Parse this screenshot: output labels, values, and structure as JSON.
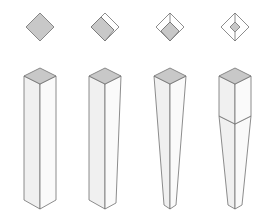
{
  "diagram": {
    "title": "",
    "colors": {
      "background": "#ffffff",
      "top_face": "#c8c8c8",
      "side_face_left": "#f2f2f2",
      "side_face_right": "#fafafa",
      "stroke": "#707070"
    },
    "columns": [
      {
        "id": "straight",
        "plan_view": {
          "type": "full-diamond"
        },
        "leg": {
          "type": "straight",
          "taper": "none"
        }
      },
      {
        "id": "one-side-taper",
        "plan_view": {
          "type": "offset-diamond"
        },
        "leg": {
          "type": "tapered",
          "taper": "one-side"
        }
      },
      {
        "id": "two-side-taper",
        "plan_view": {
          "type": "corner-diamond"
        },
        "leg": {
          "type": "tapered",
          "taper": "two-sides"
        }
      },
      {
        "id": "four-side-taper",
        "plan_view": {
          "type": "centered-diamond"
        },
        "leg": {
          "type": "tapered",
          "taper": "four-sides-below-block"
        }
      }
    ]
  }
}
